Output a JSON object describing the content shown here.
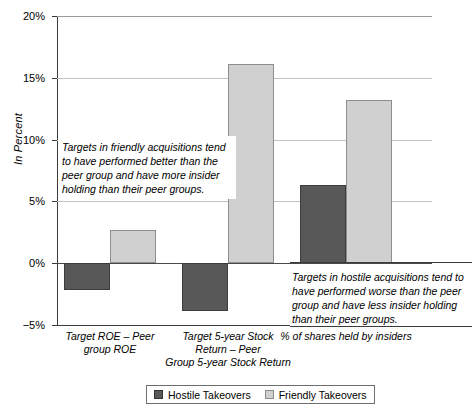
{
  "chart_data": {
    "type": "bar",
    "title": "",
    "xlabel": "",
    "ylabel": "In Percent",
    "ylim": [
      -5,
      20
    ],
    "yticks": [
      "-5%",
      "0%",
      "5%",
      "10%",
      "15%",
      "20%"
    ],
    "ytick_values": [
      -5,
      0,
      5,
      10,
      15,
      20
    ],
    "grid": true,
    "legend_position": "bottom",
    "categories": [
      "Target ROE – Peer group ROE",
      "Target 5-year Stock Return – Peer Group 5-year Stock Return",
      "% of shares held by insiders"
    ],
    "category_lines": [
      [
        "Target ROE – Peer",
        "group ROE"
      ],
      [
        "Target 5-year Stock",
        "Return – Peer",
        "Group 5-year Stock Return"
      ],
      [
        "% of shares held by insiders"
      ]
    ],
    "series": [
      {
        "name": "Hostile Takeovers",
        "color": "#585858",
        "values": [
          -2.2,
          -3.9,
          6.3
        ]
      },
      {
        "name": "Friendly Takeovers",
        "color": "#d0d0d0",
        "values": [
          2.7,
          16.1,
          13.2
        ]
      }
    ],
    "annotations": [
      {
        "id": "friendly-note",
        "text": "Targets in friendly acquisitions tend to have performed better than the peer group and have more insider holding than their peer groups."
      },
      {
        "id": "hostile-note",
        "text": "Targets in hostile acquisitions tend to have performed worse than the peer group and have less insider holding than their peer groups."
      }
    ]
  },
  "axis": {
    "y_title": "In Percent",
    "ticks": [
      "20%",
      "15%",
      "10%",
      "5%",
      "0%",
      "-5%"
    ]
  },
  "legend": {
    "items": [
      {
        "label": "Hostile Takeovers"
      },
      {
        "label": "Friendly Takeovers"
      }
    ]
  },
  "colors": {
    "hostile": "#585858",
    "friendly": "#d0d0d0",
    "axis": "#3b3b3b",
    "grid": "#c3c3c3"
  }
}
